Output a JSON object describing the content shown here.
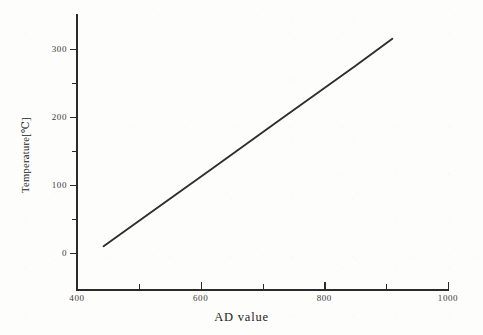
{
  "chart_data": {
    "type": "line",
    "title": "",
    "subtitle": "",
    "xlabel": "AD value",
    "ylabel": "Temperature[℃]",
    "xlim": [
      400,
      1000
    ],
    "ylim": [
      -30,
      330
    ],
    "grid": false,
    "legend": null,
    "legend_position": "none",
    "x_major_ticks": [
      400,
      600,
      800,
      1000
    ],
    "x_minor_ticks": [
      500,
      700,
      900
    ],
    "x_ticklabels": [
      "400",
      "600",
      "800",
      "1000"
    ],
    "y_major_ticks": [
      0,
      100,
      200,
      300
    ],
    "y_minor_ticks": [
      50,
      150,
      250
    ],
    "y_ticklabels": [
      "0",
      "100",
      "200",
      "300"
    ],
    "series": [
      {
        "name": "AD-to-temperature characteristic",
        "color": "#2e2e2e",
        "linewidth": 1.9,
        "x": [
          443,
          500,
          560,
          620,
          675,
          730,
          790,
          850,
          910
        ],
        "y": [
          10,
          47,
          86,
          125,
          161,
          197,
          236,
          275,
          315
        ]
      }
    ],
    "annotations": [],
    "notes": {
      "relationship": "linear",
      "slope_deg_per_AD": 0.653,
      "intercept_deg": -279.3,
      "x_start": 443,
      "x_end": 910,
      "y_start": 10,
      "y_end": 315
    }
  },
  "axes": {
    "x_title": "AD value",
    "y_title": "Temperature[℃]",
    "spine_color": "#2b2b2b",
    "tick_color": "#2b2b2b",
    "label_color": "#3a3a3a"
  },
  "figure": {
    "background": "#fdfdfb",
    "ink": "#2e2e2e"
  }
}
